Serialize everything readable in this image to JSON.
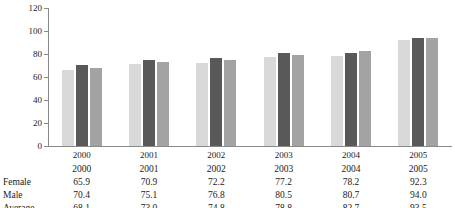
{
  "chart_data": {
    "type": "bar",
    "title": "",
    "xlabel": "",
    "ylabel": "",
    "ylim": [
      0,
      120
    ],
    "ytick_step": 20,
    "yticks": [
      0,
      20,
      40,
      60,
      80,
      100,
      120
    ],
    "grid": false,
    "legend_position": "none",
    "categories": [
      "2000",
      "2001",
      "2002",
      "2003",
      "2004",
      "2005"
    ],
    "series": [
      {
        "name": "Female",
        "color": "#d9d9d9",
        "values": [
          65.9,
          70.9,
          72.2,
          77.2,
          78.2,
          92.3
        ]
      },
      {
        "name": "Male",
        "color": "#595959",
        "values": [
          70.4,
          75.1,
          76.8,
          80.5,
          80.7,
          94.0
        ]
      },
      {
        "name": "Average",
        "color": "#a3a3a3",
        "values": [
          68.1,
          73.0,
          74.8,
          78.8,
          82.7,
          93.5
        ]
      }
    ]
  },
  "table": {
    "header": {
      "label": "",
      "cells": [
        "2000",
        "2001",
        "2002",
        "2003",
        "2004",
        "2005"
      ]
    },
    "rows": [
      {
        "label": "Female",
        "cells": [
          "65.9",
          "70.9",
          "72.2",
          "77.2",
          "78.2",
          "92.3"
        ]
      },
      {
        "label": "Male",
        "cells": [
          "70.4",
          "75.1",
          "76.8",
          "80.5",
          "80.7",
          "94.0"
        ]
      },
      {
        "label": "Average",
        "cells": [
          "68.1",
          "73.0",
          "74.8",
          "78.8",
          "82.7",
          "93.5"
        ]
      }
    ]
  },
  "axis": {
    "ytick_labels": [
      "120",
      "100",
      "80",
      "60",
      "40",
      "20",
      "0"
    ]
  },
  "colors": {
    "female": "#d9d9d9",
    "male": "#595959",
    "average": "#a3a3a3",
    "axis": "#8a8a8a",
    "text": "#1a1a1a"
  }
}
